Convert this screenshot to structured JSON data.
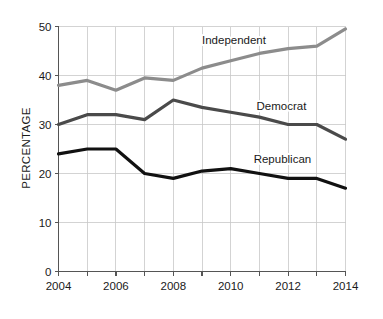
{
  "chart_data": {
    "type": "line",
    "title": "",
    "subtitle": "",
    "xlabel": "",
    "ylabel": "PERCENTAGE",
    "x": [
      2004,
      2005,
      2006,
      2007,
      2008,
      2009,
      2010,
      2011,
      2012,
      2013,
      2014
    ],
    "xlim": [
      2004,
      2014
    ],
    "ylim": [
      0,
      50
    ],
    "x_ticks_major": [
      "2004",
      "2006",
      "2008",
      "2010",
      "2012",
      "2014"
    ],
    "x_ticks_major_values": [
      2004,
      2006,
      2008,
      2010,
      2012,
      2014
    ],
    "x_ticks_minor_values": [
      2005,
      2007,
      2009,
      2011,
      2013
    ],
    "y_ticks": [
      "0",
      "10",
      "20",
      "30",
      "40",
      "50"
    ],
    "y_ticks_values": [
      0,
      10,
      20,
      30,
      40,
      50
    ],
    "grid": true,
    "legend_position": "inline-right",
    "series": [
      {
        "name": "Independent",
        "color": "#8c8c8c",
        "values": [
          38,
          39,
          37,
          39.5,
          39,
          41.5,
          43,
          44.5,
          45.5,
          46,
          49.5
        ],
        "label_x": 2009.0,
        "label_y": 46.5
      },
      {
        "name": "Democrat",
        "color": "#4a4a4a",
        "values": [
          30,
          32,
          32,
          31,
          35,
          33.5,
          32.5,
          31.5,
          30,
          30,
          27
        ],
        "label_x": 2010.9,
        "label_y": 33.0
      },
      {
        "name": "Republican",
        "color": "#111111",
        "values": [
          24,
          25,
          25,
          20,
          19,
          20.5,
          21,
          20,
          19,
          19,
          17
        ],
        "label_x": 2010.8,
        "label_y": 22.2
      }
    ]
  },
  "axes": {
    "y_title": "PERCENTAGE"
  },
  "colors": {
    "background": "#ffffff",
    "grid": "#c8c8c8",
    "axis": "#555555",
    "text": "#1a1a1a",
    "independent": "#8c8c8c",
    "democrat": "#4a4a4a",
    "republican": "#111111"
  }
}
